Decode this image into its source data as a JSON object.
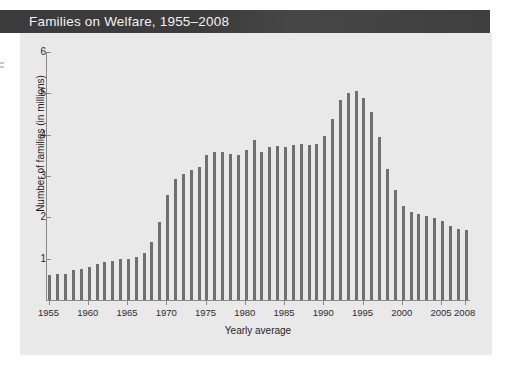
{
  "title_bar": {
    "title": "Families on Welfare, 1955–2008",
    "background_color": "#3b3b3b",
    "text_color": "#f2f2f2"
  },
  "panel": {
    "background_color": "#e9e9e9"
  },
  "chart_data": {
    "type": "bar",
    "title": "Families on Welfare, 1955–2008",
    "xlabel": "Yearly average",
    "ylabel": "Number of families (in millions)",
    "ylim": [
      0,
      6
    ],
    "y_ticks": [
      1,
      2,
      3,
      4,
      5,
      6
    ],
    "x_tick_labels": [
      "1955",
      "1960",
      "1965",
      "1970",
      "1975",
      "1980",
      "1985",
      "1990",
      "1995",
      "2000",
      "2005",
      "2008"
    ],
    "grid": false,
    "legend": null,
    "bar_color": "#6f6f6f",
    "axis_color": "#8a8a8a",
    "categories": [
      "1955",
      "1956",
      "1957",
      "1958",
      "1959",
      "1960",
      "1961",
      "1962",
      "1963",
      "1964",
      "1965",
      "1966",
      "1967",
      "1968",
      "1969",
      "1970",
      "1971",
      "1972",
      "1973",
      "1974",
      "1975",
      "1976",
      "1977",
      "1978",
      "1979",
      "1980",
      "1981",
      "1982",
      "1983",
      "1984",
      "1985",
      "1986",
      "1987",
      "1988",
      "1989",
      "1990",
      "1991",
      "1992",
      "1993",
      "1994",
      "1995",
      "1996",
      "1997",
      "1998",
      "1999",
      "2000",
      "2001",
      "2002",
      "2003",
      "2004",
      "2005",
      "2006",
      "2007",
      "2008"
    ],
    "values": [
      0.6,
      0.63,
      0.64,
      0.72,
      0.75,
      0.79,
      0.87,
      0.93,
      0.95,
      0.99,
      1.0,
      1.05,
      1.14,
      1.41,
      1.88,
      2.55,
      2.92,
      3.05,
      3.15,
      3.22,
      3.5,
      3.58,
      3.59,
      3.53,
      3.52,
      3.64,
      3.88,
      3.57,
      3.69,
      3.73,
      3.7,
      3.75,
      3.78,
      3.75,
      3.77,
      3.97,
      4.39,
      4.83,
      5.01,
      5.05,
      4.88,
      4.55,
      3.94,
      3.17,
      2.65,
      2.27,
      2.12,
      2.07,
      2.03,
      1.98,
      1.91,
      1.79,
      1.72,
      1.7
    ]
  }
}
